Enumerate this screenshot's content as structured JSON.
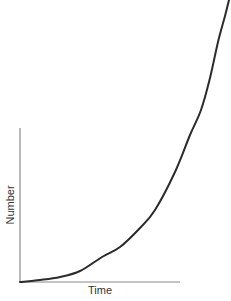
{
  "chart_data": {
    "type": "line",
    "title": "",
    "xlabel": "Time",
    "ylabel": "Number",
    "grid": false,
    "legend": null,
    "ticks": false,
    "series": [
      {
        "name": "growth",
        "color": "#2b2b2b",
        "x": [
          0,
          0.1,
          0.2,
          0.3,
          0.4,
          0.5,
          0.6,
          0.65,
          0.7,
          0.8,
          0.86,
          0.9,
          0.95,
          1.0
        ],
        "y": [
          0,
          0.01,
          0.02,
          0.04,
          0.07,
          0.11,
          0.18,
          0.22,
          0.28,
          0.43,
          0.57,
          0.66,
          0.81,
          1.0
        ]
      }
    ],
    "axis_px": {
      "origin": [
        20,
        282
      ],
      "x_end": 180,
      "y_top": 128
    },
    "plot_px_points": [
      [
        20,
        282
      ],
      [
        40,
        280
      ],
      [
        60,
        277
      ],
      [
        80,
        271
      ],
      [
        102,
        257
      ],
      [
        120,
        247
      ],
      [
        140,
        228
      ],
      [
        155,
        210
      ],
      [
        175,
        172
      ],
      [
        190,
        135
      ],
      [
        201,
        110
      ],
      [
        210,
        78
      ],
      [
        218,
        42
      ],
      [
        225,
        16
      ],
      [
        229,
        0
      ]
    ]
  },
  "labels": {
    "x": "Time",
    "y": "Number"
  }
}
